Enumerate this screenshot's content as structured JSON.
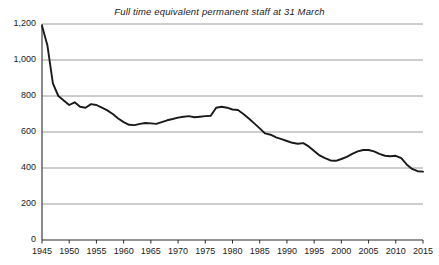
{
  "chart_data": {
    "type": "line",
    "title": "Full time equivalent permanent staff at 31 March",
    "xlabel": "",
    "ylabel": "",
    "xlim": [
      1945,
      2015
    ],
    "ylim": [
      0,
      1200
    ],
    "grid": true,
    "legend": "none",
    "y_ticks": [
      "0",
      "200",
      "400",
      "600",
      "800",
      "1,000",
      "1,200"
    ],
    "y_tick_values": [
      0,
      200,
      400,
      600,
      800,
      1000,
      1200
    ],
    "x_ticks": [
      "1945",
      "1950",
      "1955",
      "1960",
      "1965",
      "1970",
      "1975",
      "1980",
      "1985",
      "1990",
      "1995",
      "2000",
      "2005",
      "2010",
      "2015"
    ],
    "x_tick_values": [
      1945,
      1950,
      1955,
      1960,
      1965,
      1970,
      1975,
      1980,
      1985,
      1990,
      1995,
      2000,
      2005,
      2010,
      2015
    ],
    "series": [
      {
        "name": "Full time equivalent permanent staff",
        "color": "#1a1a1a",
        "x": [
          1945,
          1946,
          1947,
          1948,
          1949,
          1950,
          1951,
          1952,
          1953,
          1954,
          1955,
          1956,
          1957,
          1958,
          1959,
          1960,
          1961,
          1962,
          1963,
          1964,
          1965,
          1966,
          1967,
          1968,
          1969,
          1970,
          1971,
          1972,
          1973,
          1974,
          1975,
          1976,
          1977,
          1978,
          1979,
          1980,
          1981,
          1982,
          1983,
          1984,
          1985,
          1986,
          1987,
          1988,
          1989,
          1990,
          1991,
          1992,
          1993,
          1994,
          1995,
          1996,
          1997,
          1998,
          1999,
          2000,
          2001,
          2002,
          2003,
          2004,
          2005,
          2006,
          2007,
          2008,
          2009,
          2010,
          2011,
          2012,
          2013,
          2014,
          2015
        ],
        "values": [
          1190,
          1080,
          870,
          800,
          775,
          750,
          765,
          740,
          735,
          755,
          750,
          735,
          720,
          700,
          675,
          655,
          640,
          638,
          645,
          650,
          648,
          645,
          655,
          665,
          672,
          680,
          685,
          688,
          682,
          685,
          688,
          690,
          735,
          740,
          735,
          725,
          722,
          700,
          675,
          648,
          620,
          592,
          585,
          570,
          560,
          550,
          540,
          535,
          538,
          520,
          495,
          470,
          455,
          442,
          440,
          450,
          462,
          478,
          492,
          500,
          500,
          492,
          478,
          468,
          465,
          468,
          455,
          420,
          395,
          382,
          380
        ]
      }
    ],
    "annotations": []
  },
  "axes": {
    "y_axis_name": "y-axis",
    "x_axis_name": "x-axis"
  }
}
